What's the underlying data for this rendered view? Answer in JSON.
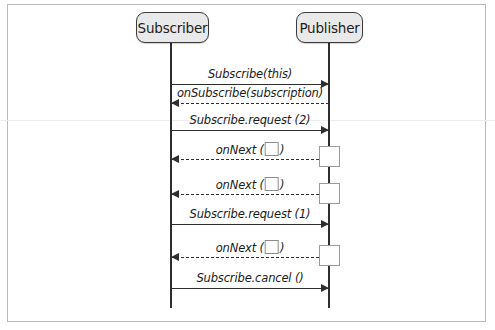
{
  "diagram": {
    "type": "uml-sequence-diagram",
    "participants": [
      {
        "id": "subscriber",
        "label": "Subscriber",
        "lifeline_x": 171,
        "box": {
          "x": 136,
          "y": 12,
          "w": 73,
          "h": 31
        }
      },
      {
        "id": "publisher",
        "label": "Publisher",
        "lifeline_x": 329,
        "box": {
          "x": 296,
          "y": 12,
          "w": 67,
          "h": 31
        }
      }
    ],
    "lifeline": {
      "top": 43,
      "bottom": 308
    },
    "messages": [
      {
        "id": "m1",
        "label": "Subscribe(this)",
        "from": "subscriber",
        "to": "publisher",
        "direction": "right",
        "style": "solid",
        "y": 84,
        "has_placeholder": false
      },
      {
        "id": "m2",
        "label": "onSubscribe(subscription)",
        "from": "publisher",
        "to": "subscriber",
        "direction": "left",
        "style": "dashed",
        "y": 103,
        "has_placeholder": false
      },
      {
        "id": "m3",
        "label": "Subscribe.request (2)",
        "from": "subscriber",
        "to": "publisher",
        "direction": "right",
        "style": "solid",
        "y": 130,
        "has_placeholder": false
      },
      {
        "id": "m4",
        "label_prefix": "onNext (",
        "label_suffix": ")",
        "label": "onNext ( )",
        "from": "publisher",
        "to": "subscriber",
        "direction": "left",
        "style": "dashed",
        "y": 159,
        "has_placeholder": true
      },
      {
        "id": "m5",
        "label_prefix": "onNext (",
        "label_suffix": ")",
        "label": "onNext ( )",
        "from": "publisher",
        "to": "subscriber",
        "direction": "left",
        "style": "dashed",
        "y": 194,
        "has_placeholder": true
      },
      {
        "id": "m6",
        "label": "Subscribe.request (1)",
        "from": "subscriber",
        "to": "publisher",
        "direction": "right",
        "style": "solid",
        "y": 224,
        "has_placeholder": false
      },
      {
        "id": "m7",
        "label_prefix": "onNext (",
        "label_suffix": ")",
        "label": "onNext ( )",
        "from": "publisher",
        "to": "subscriber",
        "direction": "left",
        "style": "dashed",
        "y": 257,
        "has_placeholder": true
      },
      {
        "id": "m8",
        "label": "Subscribe.cancel ()",
        "from": "subscriber",
        "to": "publisher",
        "direction": "right",
        "style": "solid",
        "y": 288,
        "has_placeholder": false
      }
    ],
    "activations": [
      {
        "id": "a1",
        "x": 319,
        "y": 146
      },
      {
        "id": "a2",
        "x": 319,
        "y": 183
      },
      {
        "id": "a3",
        "x": 319,
        "y": 245
      }
    ],
    "colors": {
      "line": "#2e2e2e",
      "participant_fill": "#e9e9e9",
      "participant_border": "#3a3a3a",
      "frame_border": "#b9b9b9",
      "activation_border": "#9a9a9a",
      "text": "#1b1b1b",
      "background": "#ffffff"
    },
    "artifacts": [
      {
        "id": "scanline-1",
        "y": 120
      }
    ]
  }
}
